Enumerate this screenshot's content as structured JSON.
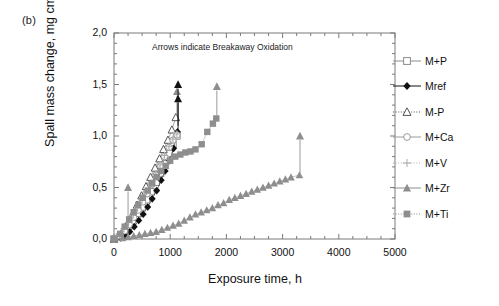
{
  "panel": {
    "label": "(b)"
  },
  "chart_data": {
    "type": "scatter",
    "title": "",
    "annotation": "Arrows indicate Breakaway Oxidation",
    "xlabel": "Exposure time, h",
    "ylabel_text": "Spall mass change, mg cm",
    "ylabel_exponent": "-2",
    "xlim": [
      0,
      5000
    ],
    "ylim": [
      0,
      2.0
    ],
    "xticks": [
      0,
      1000,
      2000,
      3000,
      4000,
      5000
    ],
    "xtick_labels": [
      "0",
      "1000",
      "2000",
      "3000",
      "4000",
      "5000"
    ],
    "yticks": [
      0.0,
      0.5,
      1.0,
      1.5,
      2.0
    ],
    "ytick_labels": [
      "0,0",
      "0,5",
      "1,0",
      "1,5",
      "2,0"
    ],
    "yminor_step": 0.1,
    "xminor_step": 250,
    "grid": false,
    "legend_position": "right-outside",
    "series": [
      {
        "name": "M+P",
        "marker": "open-square",
        "color": "#8c8c8c",
        "points": [
          [
            0,
            0.0
          ],
          [
            100,
            0.02
          ],
          [
            180,
            0.05
          ],
          [
            250,
            0.12
          ],
          [
            330,
            0.17
          ],
          [
            420,
            0.25
          ],
          [
            500,
            0.31
          ],
          [
            580,
            0.38
          ],
          [
            660,
            0.46
          ],
          [
            750,
            0.55
          ],
          [
            830,
            0.64
          ],
          [
            900,
            0.73
          ],
          [
            980,
            0.83
          ],
          [
            1050,
            0.92
          ],
          [
            1120,
            1.0
          ]
        ]
      },
      {
        "name": "Mref",
        "marker": "filled-diamond",
        "color": "#111111",
        "points": [
          [
            0,
            0.0
          ],
          [
            120,
            0.01
          ],
          [
            200,
            0.03
          ],
          [
            280,
            0.07
          ],
          [
            360,
            0.12
          ],
          [
            440,
            0.18
          ],
          [
            520,
            0.24
          ],
          [
            600,
            0.31
          ],
          [
            680,
            0.39
          ],
          [
            760,
            0.47
          ],
          [
            840,
            0.57
          ],
          [
            910,
            0.66
          ],
          [
            990,
            0.76
          ],
          [
            1060,
            0.88
          ],
          [
            1130,
            1.04
          ]
        ]
      },
      {
        "name": "M-P",
        "marker": "open-triangle",
        "color": "#555555",
        "points": [
          [
            0,
            0.0
          ],
          [
            90,
            0.03
          ],
          [
            170,
            0.09
          ],
          [
            250,
            0.16
          ],
          [
            330,
            0.24
          ],
          [
            410,
            0.33
          ],
          [
            490,
            0.42
          ],
          [
            570,
            0.51
          ],
          [
            650,
            0.6
          ],
          [
            730,
            0.69
          ],
          [
            810,
            0.78
          ],
          [
            880,
            0.87
          ],
          [
            960,
            0.96
          ],
          [
            1030,
            1.06
          ],
          [
            1100,
            1.18
          ]
        ]
      },
      {
        "name": "M+Ca",
        "marker": "open-circle",
        "color": "#9a9a9a",
        "points": [
          [
            0,
            0.0
          ],
          [
            110,
            0.03
          ],
          [
            190,
            0.08
          ],
          [
            270,
            0.14
          ],
          [
            350,
            0.21
          ],
          [
            430,
            0.28
          ],
          [
            510,
            0.36
          ],
          [
            590,
            0.44
          ],
          [
            670,
            0.53
          ],
          [
            750,
            0.62
          ],
          [
            830,
            0.71
          ],
          [
            900,
            0.8
          ],
          [
            980,
            0.89
          ],
          [
            1050,
            0.96
          ],
          [
            1120,
            1.01
          ]
        ]
      },
      {
        "name": "M+V",
        "marker": "plus",
        "color": "#b0b0b0",
        "points": [
          [
            0,
            0.0
          ],
          [
            100,
            0.04
          ],
          [
            180,
            0.1
          ],
          [
            260,
            0.16
          ],
          [
            340,
            0.23
          ],
          [
            420,
            0.3
          ],
          [
            500,
            0.38
          ],
          [
            580,
            0.46
          ],
          [
            660,
            0.54
          ],
          [
            740,
            0.63
          ],
          [
            820,
            0.72
          ],
          [
            900,
            0.81
          ],
          [
            980,
            0.9
          ],
          [
            1050,
            0.97
          ],
          [
            1120,
            1.02
          ]
        ]
      },
      {
        "name": "M+Zr",
        "marker": "filled-triangle",
        "color": "#8e8e8e",
        "points": [
          [
            0,
            0.0
          ],
          [
            150,
            0.01
          ],
          [
            250,
            0.02
          ],
          [
            350,
            0.03
          ],
          [
            450,
            0.04
          ],
          [
            550,
            0.05
          ],
          [
            650,
            0.06
          ],
          [
            750,
            0.07
          ],
          [
            850,
            0.09
          ],
          [
            950,
            0.11
          ],
          [
            1050,
            0.13
          ],
          [
            1150,
            0.15
          ],
          [
            1250,
            0.18
          ],
          [
            1350,
            0.21
          ],
          [
            1450,
            0.24
          ],
          [
            1550,
            0.26
          ],
          [
            1650,
            0.28
          ],
          [
            1750,
            0.3
          ],
          [
            1850,
            0.33
          ],
          [
            1950,
            0.35
          ],
          [
            2050,
            0.38
          ],
          [
            2150,
            0.4
          ],
          [
            2250,
            0.42
          ],
          [
            2350,
            0.44
          ],
          [
            2450,
            0.46
          ],
          [
            2550,
            0.48
          ],
          [
            2650,
            0.5
          ],
          [
            2750,
            0.52
          ],
          [
            2850,
            0.54
          ],
          [
            2950,
            0.56
          ],
          [
            3050,
            0.58
          ],
          [
            3150,
            0.6
          ],
          [
            3300,
            0.62
          ]
        ]
      },
      {
        "name": "M+Ti",
        "marker": "filled-square",
        "color": "#8e8e8e",
        "points": [
          [
            0,
            0.0
          ],
          [
            110,
            0.05
          ],
          [
            190,
            0.12
          ],
          [
            270,
            0.19
          ],
          [
            350,
            0.26
          ],
          [
            430,
            0.33
          ],
          [
            510,
            0.4
          ],
          [
            600,
            0.47
          ],
          [
            680,
            0.54
          ],
          [
            760,
            0.6
          ],
          [
            840,
            0.66
          ],
          [
            920,
            0.71
          ],
          [
            1000,
            0.76
          ],
          [
            1090,
            0.8
          ],
          [
            1180,
            0.82
          ],
          [
            1270,
            0.84
          ],
          [
            1360,
            0.85
          ],
          [
            1450,
            0.87
          ],
          [
            1560,
            0.92
          ],
          [
            1660,
            1.04
          ],
          [
            1760,
            1.12
          ],
          [
            1820,
            1.17
          ]
        ]
      }
    ],
    "breakaway_arrows": [
      {
        "series": "M+Zr",
        "x": 250,
        "y_from": 0.04,
        "y_to": 0.5,
        "marker": "filled-triangle",
        "color": "#8e8e8e"
      },
      {
        "series": "M-P",
        "x": 1120,
        "y_from": 1.2,
        "y_to": 1.43,
        "marker": "filled-triangle",
        "color": "#8e8e8e"
      },
      {
        "series": "Mref",
        "x": 1140,
        "y_from": 1.1,
        "y_to": 1.5,
        "marker": "filled-triangle",
        "color": "#111111"
      },
      {
        "series": "Mref",
        "x": 1140,
        "y_from": 1.06,
        "y_to": 1.36,
        "marker": "filled-triangle",
        "color": "#111111"
      },
      {
        "series": "M+Ti",
        "x": 1830,
        "y_from": 1.2,
        "y_to": 1.48,
        "marker": "filled-triangle",
        "color": "#8e8e8e"
      },
      {
        "series": "M+Zr",
        "x": 3310,
        "y_from": 0.64,
        "y_to": 1.0,
        "marker": "filled-triangle",
        "color": "#8e8e8e"
      }
    ]
  }
}
